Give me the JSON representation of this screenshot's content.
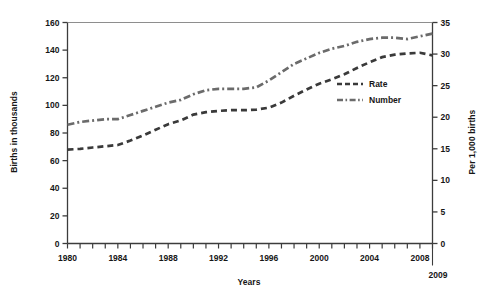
{
  "chart_data": {
    "type": "line",
    "title": "",
    "xlabel": "Years",
    "ylabel": "Births in thousands",
    "y2label": "Per 1,000 births",
    "xlim": [
      1980,
      2009
    ],
    "ylim": [
      0,
      160
    ],
    "y2lim": [
      0,
      35
    ],
    "grid": false,
    "legend_position": "center-right inside plot",
    "x": [
      1980,
      1981,
      1982,
      1983,
      1984,
      1985,
      1986,
      1987,
      1988,
      1989,
      1990,
      1991,
      1992,
      1993,
      1994,
      1995,
      1996,
      1997,
      1998,
      1999,
      2000,
      2001,
      2002,
      2003,
      2004,
      2005,
      2006,
      2007,
      2008,
      2009
    ],
    "series": [
      {
        "name": "Rate",
        "axis": "right",
        "units": "per 1,000 births",
        "style": "dashed",
        "color": "#3a3a3a",
        "values": [
          14.9,
          15.0,
          15.2,
          15.4,
          15.6,
          16.3,
          17.1,
          18.0,
          18.9,
          19.5,
          20.4,
          20.8,
          21.0,
          21.1,
          21.1,
          21.2,
          21.5,
          22.3,
          23.4,
          24.4,
          25.3,
          26.0,
          26.8,
          27.8,
          28.7,
          29.5,
          29.9,
          30.1,
          30.2,
          29.8
        ],
        "values_left_scale_equivalent": [
          68,
          68.5,
          69.5,
          70.4,
          71.3,
          74.5,
          78.2,
          82.3,
          86.4,
          89.1,
          93.3,
          95.1,
          96.0,
          96.5,
          96.5,
          96.9,
          98.3,
          102.0,
          107.0,
          111.5,
          115.7,
          118.9,
          122.5,
          127.1,
          131.2,
          134.9,
          136.7,
          137.6,
          138.1,
          136.2
        ]
      },
      {
        "name": "Number",
        "axis": "left",
        "units": "births in thousands",
        "style": "dash-dot",
        "color": "#6b6b6b",
        "values": [
          86,
          88,
          89,
          90,
          90,
          93,
          96,
          99,
          102,
          104,
          108,
          111,
          112,
          112,
          112,
          113,
          118,
          124,
          130,
          134,
          138,
          141,
          143,
          146,
          148,
          149,
          149,
          148,
          150,
          152
        ],
        "values_right_scale_equivalent": [
          18.8,
          19.3,
          19.5,
          19.7,
          19.7,
          20.3,
          21.0,
          21.7,
          22.3,
          22.8,
          23.6,
          24.3,
          24.5,
          24.5,
          24.5,
          24.7,
          25.8,
          27.1,
          28.4,
          29.3,
          30.2,
          30.8,
          31.3,
          31.9,
          32.4,
          32.6,
          32.6,
          32.4,
          32.8,
          33.3
        ]
      }
    ],
    "y_ticks": [
      0,
      20,
      40,
      60,
      80,
      100,
      120,
      140,
      160
    ],
    "y2_ticks": [
      0,
      5,
      10,
      15,
      20,
      25,
      30,
      35
    ],
    "x_ticks": [
      1980,
      1981,
      1982,
      1983,
      1984,
      1985,
      1986,
      1987,
      1988,
      1989,
      1990,
      1991,
      1992,
      1993,
      1994,
      1995,
      1996,
      1997,
      1998,
      1999,
      2000,
      2001,
      2002,
      2003,
      2004,
      2005,
      2006,
      2007,
      2008,
      2009
    ],
    "x_tick_labels": [
      "1980",
      "1984",
      "1988",
      "1992",
      "1996",
      "2000",
      "2004",
      "2008"
    ],
    "x_tick_label_values": [
      1980,
      1984,
      1988,
      1992,
      1996,
      2000,
      2004,
      2008
    ],
    "end_year_label": "2009",
    "legend": [
      {
        "label": "Rate",
        "style": "dashed"
      },
      {
        "label": "Number",
        "style": "dash-dot"
      }
    ]
  },
  "axes": {
    "left_title": "Births in thousands",
    "right_title": "Per 1,000 births",
    "bottom_title": "Years"
  },
  "colors": {
    "background": "#ffffff",
    "axis": "#3c3c3c",
    "rate_line": "#3a3a3a",
    "number_line": "#6b6b6b",
    "text": "#161616"
  }
}
